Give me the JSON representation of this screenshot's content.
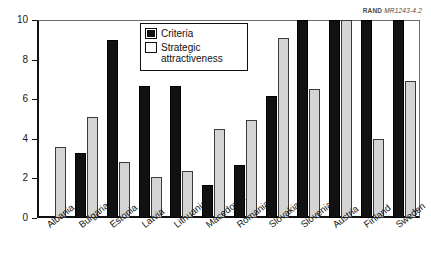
{
  "credit": {
    "org": "RAND",
    "code": "MR1243-4.2"
  },
  "legend": {
    "items": [
      {
        "label": "Criteria",
        "color": "#111111"
      },
      {
        "label": "Strategic",
        "label2": "attractiveness",
        "color": "#d4d4d4"
      }
    ]
  },
  "chart_data": {
    "type": "bar",
    "title": "",
    "xlabel": "",
    "ylabel": "",
    "ylim": [
      0,
      10
    ],
    "yticks": [
      0,
      2,
      4,
      6,
      8,
      10
    ],
    "ytick_labels": [
      "0",
      "2",
      "4",
      "6",
      "8",
      "10"
    ],
    "grid": false,
    "legend_position": "top-center",
    "categories": [
      "Albania",
      "Bulgaria",
      "Estonia",
      "Latvia",
      "Lithuania",
      "Macedonia",
      "Romania",
      "Slovakia",
      "Slovenia",
      "Austria",
      "Finland",
      "Sweden"
    ],
    "series": [
      {
        "name": "Criteria",
        "color": "#111111",
        "values": [
          0,
          3.3,
          9.0,
          6.65,
          6.65,
          1.65,
          2.7,
          6.15,
          10,
          10,
          10,
          10
        ]
      },
      {
        "name": "Strategic attractiveness",
        "color": "#d4d4d4",
        "values": [
          3.6,
          5.1,
          2.85,
          2.05,
          2.35,
          4.5,
          4.95,
          9.1,
          6.5,
          10,
          4.0,
          6.9
        ]
      }
    ]
  }
}
